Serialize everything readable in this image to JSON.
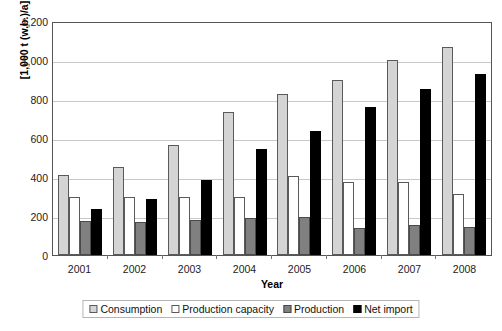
{
  "chart_data": {
    "type": "bar",
    "title": "",
    "subtitle": "",
    "xlabel": "Year",
    "ylabel": "[1,000 t (w.b.)/a]",
    "categories": [
      "2001",
      "2002",
      "2003",
      "2004",
      "2005",
      "2006",
      "2007",
      "2008"
    ],
    "ylim": [
      0,
      1200
    ],
    "ytick_values": [
      0,
      200,
      400,
      600,
      800,
      1000,
      1200
    ],
    "ytick_labels": [
      "0",
      "200",
      "400",
      "600",
      "800",
      "1,000",
      "1,200"
    ],
    "grid": true,
    "legend_position": "bottom",
    "series": [
      {
        "name": "Consumption",
        "color": "#d4d4d4",
        "values": [
          410,
          450,
          565,
          735,
          825,
          895,
          1000,
          1065
        ]
      },
      {
        "name": "Production capacity",
        "color": "#ffffff",
        "values": [
          300,
          300,
          295,
          300,
          405,
          375,
          375,
          315
        ]
      },
      {
        "name": "Production",
        "color": "#808080",
        "values": [
          175,
          170,
          180,
          190,
          195,
          140,
          155,
          145
        ]
      },
      {
        "name": "Net import",
        "color": "#000000",
        "values": [
          235,
          285,
          385,
          545,
          635,
          760,
          850,
          930
        ]
      }
    ]
  },
  "legend": {
    "items": [
      {
        "label": "Consumption"
      },
      {
        "label": "Production capacity"
      },
      {
        "label": "Production"
      },
      {
        "label": "Net import"
      }
    ]
  }
}
